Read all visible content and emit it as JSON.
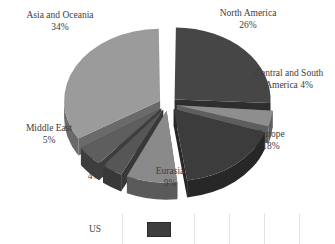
{
  "chart_data": {
    "type": "pie",
    "title": "",
    "subtitle": "",
    "xlabel": "",
    "ylabel": "",
    "unit": "%",
    "exploded": true,
    "three_d": true,
    "start_angle_deg": 0,
    "grid": false,
    "legend_position": "bottom",
    "categories": [
      "North America",
      "Central and South America",
      "Europe",
      "Eurasia",
      "Africa",
      "Middle East",
      "Asia and Oceania"
    ],
    "values": [
      26,
      4,
      18,
      9,
      4,
      5,
      34
    ],
    "labels": [
      "North America\n26%",
      "Central and South\nAmerica 4%",
      "Europe\n18%",
      "Eurasia\n9%",
      "Africa\n4%",
      "Middle East\n5%",
      "Asia and Oceania\n34%"
    ],
    "slice_colors": [
      "#464646",
      "#8e8e8e",
      "#3c3c3c",
      "#8a8a8a",
      "#565656",
      "#5e5e5e",
      "#9b9b9b"
    ],
    "slice_side_colors": [
      "#2e2e2e",
      "#5e5e5e",
      "#272727",
      "#5a5a5a",
      "#383838",
      "#3e3e3e",
      "#6a6a6a"
    ],
    "slices": [
      {
        "name": "North America",
        "value": 26,
        "label": "North America",
        "percent_text": "26%",
        "color": "#464646"
      },
      {
        "name": "Central and South America",
        "value": 4,
        "label": "Central and South America",
        "percent_text": "4%",
        "color": "#8e8e8e"
      },
      {
        "name": "Europe",
        "value": 18,
        "label": "Europe",
        "percent_text": "18%",
        "color": "#3c3c3c"
      },
      {
        "name": "Eurasia",
        "value": 9,
        "label": "Eurasia",
        "percent_text": "9%",
        "color": "#8a8a8a"
      },
      {
        "name": "Africa",
        "value": 4,
        "label": "Africa",
        "percent_text": "4%",
        "color": "#565656"
      },
      {
        "name": "Middle East",
        "value": 5,
        "label": "Middle East",
        "percent_text": "5%",
        "color": "#5e5e5e"
      },
      {
        "name": "Asia and Oceania",
        "value": 34,
        "label": "Asia and Oceania",
        "percent_text": "34%",
        "color": "#9b9b9b"
      }
    ]
  },
  "labels": {
    "north_america": "North America\n26%",
    "central_south_america": "Central and South\nAmerica 4%",
    "europe": "Europe\n18%",
    "eurasia": "Eurasia\n9%",
    "africa": "Africa\n4%",
    "middle_east": "Middle East\n5%",
    "asia_oceania": "Asia and Oceania\n34%"
  },
  "legend": {
    "row_label": "US",
    "swatch_color": "#3e3e3e"
  },
  "colors": {
    "background": "#ffffff",
    "text": "#3d3d3d",
    "divider": "#e2e2e2"
  }
}
